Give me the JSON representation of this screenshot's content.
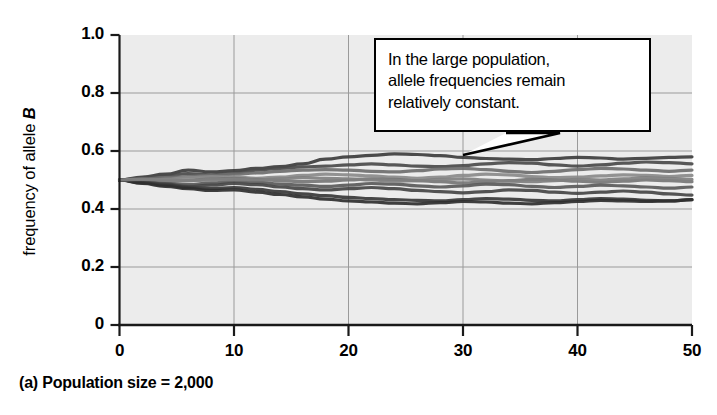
{
  "figure": {
    "caption": "(a) Population size = 2,000",
    "annotation": {
      "name": "callout-box",
      "lines": [
        "In the large population,",
        "allele frequencies remain",
        "relatively constant."
      ],
      "pointer_target_x": 30,
      "pointer_target_y": 0.545
    },
    "colors": {
      "plot_background": "#ececec",
      "gridline": "#9a9a9a",
      "axis": "#1a1a1a",
      "page_background": "#ffffff"
    }
  },
  "chart_data": {
    "type": "line",
    "title": "",
    "xlabel": "",
    "ylabel": "frequency of allele B",
    "ylabel_italic_part": "B",
    "xlim": [
      0,
      50
    ],
    "ylim": [
      0,
      1.0
    ],
    "xticks": [
      0,
      10,
      20,
      30,
      40,
      50
    ],
    "xtick_labels": [
      "0",
      "10",
      "20",
      "30",
      "40",
      "50"
    ],
    "yticks": [
      0,
      0.2,
      0.4,
      0.6,
      0.8,
      1.0
    ],
    "ytick_labels": [
      "0",
      "0.2",
      "0.4",
      "0.6",
      "0.8",
      "1.0"
    ],
    "grid": true,
    "legend": "none",
    "x": [
      0,
      2,
      4,
      6,
      8,
      10,
      12,
      14,
      16,
      18,
      20,
      22,
      24,
      26,
      28,
      30,
      32,
      34,
      36,
      38,
      40,
      42,
      44,
      46,
      48,
      50
    ],
    "series": [
      {
        "name": "replicate-1",
        "color": "#3d3d3d",
        "values": [
          0.5,
          0.51,
          0.52,
          0.534,
          0.528,
          0.532,
          0.54,
          0.546,
          0.556,
          0.572,
          0.58,
          0.585,
          0.59,
          0.588,
          0.584,
          0.578,
          0.574,
          0.572,
          0.57,
          0.574,
          0.578,
          0.576,
          0.572,
          0.575,
          0.578,
          0.58
        ]
      },
      {
        "name": "replicate-2",
        "color": "#4a4a4a",
        "values": [
          0.5,
          0.506,
          0.514,
          0.522,
          0.518,
          0.524,
          0.534,
          0.54,
          0.545,
          0.548,
          0.552,
          0.556,
          0.552,
          0.548,
          0.546,
          0.55,
          0.556,
          0.56,
          0.558,
          0.552,
          0.548,
          0.552,
          0.558,
          0.562,
          0.56,
          0.556
        ]
      },
      {
        "name": "replicate-3",
        "color": "#6e6e6e",
        "values": [
          0.5,
          0.504,
          0.508,
          0.512,
          0.516,
          0.52,
          0.524,
          0.53,
          0.534,
          0.536,
          0.534,
          0.53,
          0.528,
          0.532,
          0.538,
          0.54,
          0.536,
          0.53,
          0.526,
          0.53,
          0.536,
          0.54,
          0.538,
          0.534,
          0.53,
          0.534
        ]
      },
      {
        "name": "replicate-4",
        "color": "#8a8a8a",
        "values": [
          0.5,
          0.498,
          0.502,
          0.508,
          0.512,
          0.51,
          0.506,
          0.51,
          0.516,
          0.52,
          0.518,
          0.514,
          0.51,
          0.506,
          0.51,
          0.516,
          0.52,
          0.518,
          0.512,
          0.508,
          0.51,
          0.514,
          0.518,
          0.516,
          0.512,
          0.516
        ]
      },
      {
        "name": "replicate-5",
        "color": "#767676",
        "values": [
          0.5,
          0.496,
          0.494,
          0.498,
          0.504,
          0.506,
          0.502,
          0.498,
          0.494,
          0.496,
          0.5,
          0.504,
          0.502,
          0.498,
          0.494,
          0.49,
          0.494,
          0.498,
          0.502,
          0.5,
          0.496,
          0.492,
          0.496,
          0.5,
          0.498,
          0.494
        ]
      },
      {
        "name": "replicate-6",
        "color": "#5a5a5a",
        "values": [
          0.5,
          0.494,
          0.488,
          0.484,
          0.49,
          0.496,
          0.492,
          0.486,
          0.482,
          0.478,
          0.482,
          0.488,
          0.486,
          0.48,
          0.476,
          0.48,
          0.486,
          0.484,
          0.478,
          0.474,
          0.478,
          0.482,
          0.48,
          0.476,
          0.472,
          0.476
        ]
      },
      {
        "name": "replicate-7",
        "color": "#454545",
        "values": [
          0.5,
          0.492,
          0.486,
          0.478,
          0.482,
          0.488,
          0.484,
          0.476,
          0.47,
          0.466,
          0.47,
          0.474,
          0.47,
          0.464,
          0.46,
          0.456,
          0.46,
          0.466,
          0.464,
          0.458,
          0.454,
          0.458,
          0.462,
          0.458,
          0.452,
          0.448
        ]
      },
      {
        "name": "replicate-8",
        "color": "#383838",
        "values": [
          0.5,
          0.49,
          0.482,
          0.474,
          0.47,
          0.474,
          0.468,
          0.46,
          0.452,
          0.446,
          0.44,
          0.436,
          0.432,
          0.43,
          0.428,
          0.432,
          0.436,
          0.434,
          0.43,
          0.428,
          0.432,
          0.436,
          0.434,
          0.43,
          0.428,
          0.432
        ]
      },
      {
        "name": "replicate-9",
        "color": "#2f2f2f",
        "values": [
          0.5,
          0.488,
          0.478,
          0.47,
          0.464,
          0.466,
          0.458,
          0.45,
          0.442,
          0.434,
          0.428,
          0.424,
          0.42,
          0.418,
          0.422,
          0.426,
          0.424,
          0.42,
          0.418,
          0.422,
          0.426,
          0.43,
          0.428,
          0.426,
          0.428,
          0.432
        ]
      },
      {
        "name": "replicate-10",
        "color": "#808080",
        "values": [
          0.5,
          0.502,
          0.5,
          0.498,
          0.5,
          0.502,
          0.5,
          0.504,
          0.508,
          0.506,
          0.504,
          0.5,
          0.496,
          0.498,
          0.502,
          0.504,
          0.5,
          0.496,
          0.494,
          0.498,
          0.502,
          0.5,
          0.504,
          0.508,
          0.506,
          0.502
        ]
      }
    ]
  }
}
